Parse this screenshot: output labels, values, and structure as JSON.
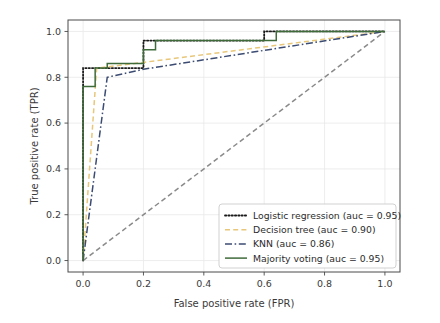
{
  "chart_data": {
    "type": "line",
    "title": "",
    "xlabel": "False positive rate (FPR)",
    "ylabel": "True positive rate (TPR)",
    "xlim": [
      -0.05,
      1.05
    ],
    "ylim": [
      -0.05,
      1.05
    ],
    "xticks": [
      "0.0",
      "0.2",
      "0.4",
      "0.6",
      "0.8",
      "1.0"
    ],
    "xtick_values": [
      0.0,
      0.2,
      0.4,
      0.6,
      0.8,
      1.0
    ],
    "yticks": [
      "0.0",
      "0.2",
      "0.4",
      "0.6",
      "0.8",
      "1.0"
    ],
    "ytick_values": [
      0.0,
      0.2,
      0.4,
      0.6,
      0.8,
      1.0
    ],
    "grid": true,
    "legend_position": "lower right",
    "series": [
      {
        "name": "Logistic regression (auc = 0.95)",
        "short_name": "Logistic regression",
        "auc": "0.95",
        "color": "#1a1a1a",
        "style": "dotted",
        "x": [
          0.0,
          0.0,
          0.2,
          0.2,
          0.6,
          0.6,
          1.0
        ],
        "y": [
          0.0,
          0.84,
          0.84,
          0.96,
          0.96,
          1.0,
          1.0
        ]
      },
      {
        "name": "Decision tree (auc = 0.90)",
        "short_name": "Decision tree",
        "auc": "0.90",
        "color": "#e8c77a",
        "style": "dashed",
        "x": [
          0.0,
          0.045,
          0.2,
          1.0
        ],
        "y": [
          0.0,
          0.84,
          0.865,
          1.0
        ]
      },
      {
        "name": "KNN (auc = 0.86)",
        "short_name": "KNN",
        "auc": "0.86",
        "color": "#3b4b72",
        "style": "dashdot",
        "x": [
          0.0,
          0.08,
          0.2,
          1.0
        ],
        "y": [
          0.0,
          0.8,
          0.835,
          1.0
        ]
      },
      {
        "name": "Majority voting (auc = 0.95)",
        "short_name": "Majority voting",
        "auc": "0.95",
        "color": "#3f6b3a",
        "style": "solid",
        "x": [
          0.0,
          0.0,
          0.04,
          0.04,
          0.08,
          0.08,
          0.2,
          0.2,
          0.24,
          0.24,
          0.64,
          0.64,
          1.0
        ],
        "y": [
          0.0,
          0.76,
          0.76,
          0.84,
          0.84,
          0.86,
          0.86,
          0.92,
          0.92,
          0.96,
          0.96,
          1.0,
          1.0
        ]
      }
    ],
    "reference_line": {
      "name": "chance-diagonal",
      "color": "#8a8a8a",
      "style": "dashed",
      "x": [
        0.0,
        1.0
      ],
      "y": [
        0.0,
        1.0
      ]
    }
  }
}
